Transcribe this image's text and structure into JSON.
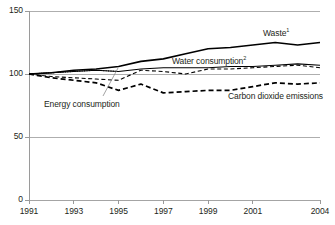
{
  "chart_data": {
    "type": "line",
    "title": "",
    "subtitle": "",
    "xlabel": "",
    "ylabel": "",
    "xlim": [
      1991,
      2004
    ],
    "ylim": [
      0,
      150
    ],
    "grid": true,
    "legend_position": "inline-annotations",
    "x": [
      1991,
      1992,
      1993,
      1994,
      1995,
      1996,
      1997,
      1998,
      1999,
      2000,
      2001,
      2002,
      2003,
      2004
    ],
    "y_ticks": [
      "0",
      "50",
      "100",
      "150"
    ],
    "y_tick_values": [
      0,
      50,
      100,
      150
    ],
    "x_ticks": [
      "1991",
      "1993",
      "1995",
      "1997",
      "1999",
      "2001",
      "2004"
    ],
    "x_tick_values": [
      1991,
      1993,
      1995,
      1997,
      1999,
      2001,
      2004
    ],
    "series": [
      {
        "name": "Waste",
        "label": "Waste",
        "footnote": "1",
        "style": "solid",
        "width": 1.6,
        "color": "#000000",
        "values": [
          100,
          101,
          103,
          104,
          106,
          110,
          112,
          116,
          120,
          121,
          123,
          125,
          123,
          125
        ]
      },
      {
        "name": "Water consumption",
        "label": "Water consumption",
        "footnote": "2",
        "style": "solid",
        "width": 1.1,
        "color": "#000000",
        "values": [
          100,
          101,
          102,
          103,
          102,
          104,
          105,
          105,
          105,
          106,
          106,
          107,
          108,
          107
        ]
      },
      {
        "name": "Energy consumption",
        "label": "Energy consumption",
        "footnote": "",
        "style": "dashed",
        "width": 1.1,
        "color": "#000000",
        "values": [
          100,
          98,
          97,
          96,
          95,
          103,
          102,
          100,
          104,
          104,
          105,
          106,
          107,
          105
        ]
      },
      {
        "name": "Carbon dioxide emissions",
        "label": "Carbon dioxide emissions",
        "footnote": "",
        "style": "dashed",
        "width": 1.7,
        "color": "#000000",
        "values": [
          100,
          97,
          95,
          93,
          87,
          92,
          85,
          86,
          87,
          87,
          90,
          93,
          92,
          93
        ]
      }
    ],
    "dotted_overlay": {
      "name": "Water consumption early dotted",
      "x": [
        1991,
        1992,
        1993,
        1994,
        1995
      ],
      "values": [
        100,
        101,
        102,
        103,
        102
      ]
    },
    "annotations": [
      {
        "text": "Waste",
        "footnote": "1",
        "x_px": 263,
        "y_px": 28
      },
      {
        "text": "Water consumption",
        "footnote": "2",
        "x_px": 172,
        "y_px": 56
      },
      {
        "text": "Energy consumption",
        "footnote": "",
        "x_px": 44,
        "y_px": 99
      },
      {
        "text": "Carbon dioxide emissions",
        "footnote": "",
        "x_px": 228,
        "y_px": 91
      }
    ]
  },
  "colors": {
    "axis": "#231f20",
    "gridline": "#9a9a9a",
    "line": "#000000",
    "background": "#ffffff",
    "text": "#231f20"
  }
}
